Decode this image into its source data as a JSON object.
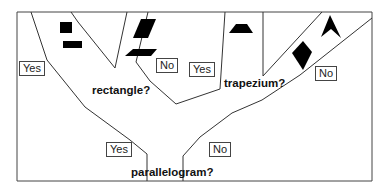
{
  "diagram": {
    "type": "decision-tree",
    "questions": {
      "rectangle": "rectangle?",
      "trapezium": "trapezium?",
      "parallelogram": "parallelogram?"
    },
    "labels": {
      "rectangle_yes": "Yes",
      "rectangle_no": "No",
      "trapezium_yes": "Yes",
      "trapezium_no": "No",
      "parallelogram_yes": "Yes",
      "parallelogram_no": "No"
    },
    "shapes": [
      {
        "name": "square",
        "branch": "rectangle-yes"
      },
      {
        "name": "rectangle",
        "branch": "rectangle-yes"
      },
      {
        "name": "parallelogram-upright",
        "branch": "rectangle-no"
      },
      {
        "name": "parallelogram-flat",
        "branch": "rectangle-no"
      },
      {
        "name": "trapezium",
        "branch": "trapezium-yes"
      },
      {
        "name": "kite",
        "branch": "parallelogram-no"
      },
      {
        "name": "arrowhead",
        "branch": "parallelogram-no"
      }
    ],
    "colors": {
      "line": "#333333",
      "shape_fill": "#000000",
      "background": "#ffffff"
    }
  }
}
